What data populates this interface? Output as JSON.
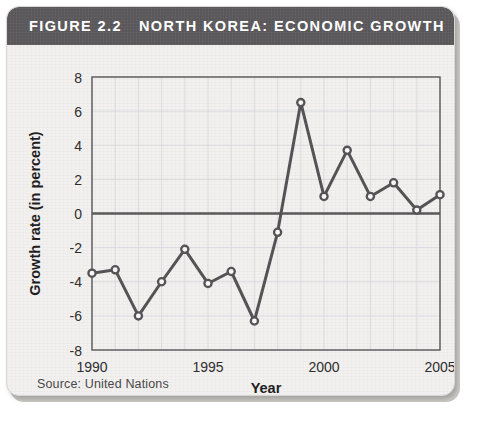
{
  "figure": {
    "label": "FIGURE 2.2",
    "title": "NORTH KOREA: ECONOMIC GROWTH",
    "source_note": "Source: United Nations",
    "header_bg": "#59575a",
    "card_bg": "#f2f1ef",
    "line_color": "#555356",
    "marker_fill": "#f7f7f7",
    "grid_color": "#d6d6dc",
    "axis_color": "#5a585a"
  },
  "chart_data": {
    "type": "line",
    "title": "NORTH KOREA: ECONOMIC GROWTH",
    "xlabel": "Year",
    "ylabel": "Growth rate (in percent)",
    "x": [
      1990,
      1991,
      1992,
      1993,
      1994,
      1995,
      1996,
      1997,
      1998,
      1999,
      2000,
      2001,
      2002,
      2003,
      2004,
      2005
    ],
    "values": [
      -3.5,
      -3.3,
      -6.0,
      -4.0,
      -2.1,
      -4.1,
      -3.4,
      -6.3,
      -1.1,
      6.5,
      1.0,
      3.7,
      1.0,
      1.8,
      0.2,
      1.1
    ],
    "series": [
      {
        "name": "Growth rate",
        "values": [
          -3.5,
          -3.3,
          -6.0,
          -4.0,
          -2.1,
          -4.1,
          -3.4,
          -6.3,
          -1.1,
          6.5,
          1.0,
          3.7,
          1.0,
          1.8,
          0.2,
          1.1
        ]
      }
    ],
    "xlim": [
      1990,
      2005
    ],
    "ylim": [
      -8,
      8
    ],
    "xticks": [
      1990,
      1995,
      2000,
      2005
    ],
    "xtick_labels": [
      "1990",
      "1995",
      "2000",
      "2005"
    ],
    "yticks": [
      -8,
      -6,
      -4,
      -2,
      0,
      2,
      4,
      6,
      8
    ],
    "ytick_labels": [
      "-8",
      "-6",
      "-4",
      "-2",
      "0",
      "2",
      "4",
      "6",
      "8"
    ],
    "grid": true,
    "grid_x_step": 1,
    "grid_y_step": 2,
    "zero_line": 0,
    "legend": null,
    "marker": "circle"
  }
}
